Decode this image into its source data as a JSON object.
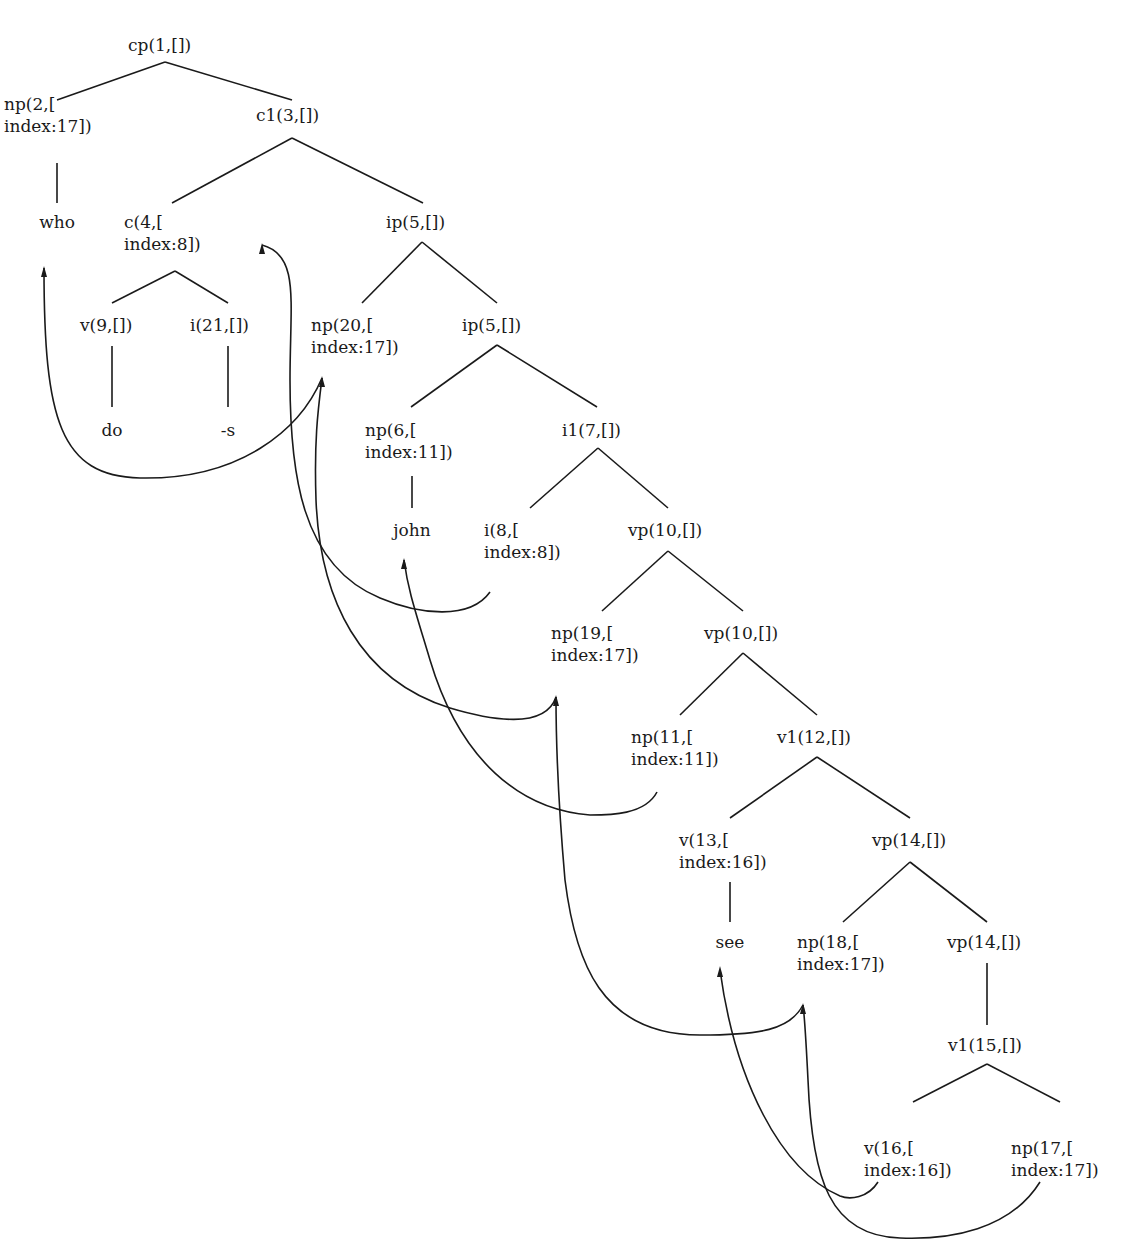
{
  "diagram": {
    "type": "syntax-tree",
    "line_color": "#1a1a1a",
    "nodes": [
      {
        "id": "cp1",
        "lines": [
          "cp(1,[])"
        ],
        "x": 128,
        "y": 34
      },
      {
        "id": "np2",
        "lines": [
          "np(2,[",
          "index:17])"
        ],
        "x": 4,
        "y": 93
      },
      {
        "id": "c1_3",
        "lines": [
          "c1(3,[])"
        ],
        "x": 256,
        "y": 104
      },
      {
        "id": "who",
        "lines": [
          "who"
        ],
        "x": 57,
        "y": 211,
        "leaf": true
      },
      {
        "id": "c4",
        "lines": [
          "c(4,[",
          "index:8])"
        ],
        "x": 124,
        "y": 211
      },
      {
        "id": "ip5a",
        "lines": [
          "ip(5,[])"
        ],
        "x": 386,
        "y": 211
      },
      {
        "id": "v9",
        "lines": [
          "v(9,[])"
        ],
        "x": 80,
        "y": 314
      },
      {
        "id": "i21",
        "lines": [
          "i(21,[])"
        ],
        "x": 190,
        "y": 314
      },
      {
        "id": "np20",
        "lines": [
          "np(20,[",
          "index:17])"
        ],
        "x": 311,
        "y": 314
      },
      {
        "id": "ip5b",
        "lines": [
          "ip(5,[])"
        ],
        "x": 462,
        "y": 314
      },
      {
        "id": "do",
        "lines": [
          "do"
        ],
        "x": 112,
        "y": 419,
        "leaf": true
      },
      {
        "id": "s",
        "lines": [
          "-s"
        ],
        "x": 228,
        "y": 419,
        "leaf": true
      },
      {
        "id": "np6",
        "lines": [
          "np(6,[",
          "index:11])"
        ],
        "x": 365,
        "y": 419
      },
      {
        "id": "i1_7",
        "lines": [
          "i1(7,[])"
        ],
        "x": 562,
        "y": 419
      },
      {
        "id": "john",
        "lines": [
          "john"
        ],
        "x": 412,
        "y": 519,
        "leaf": true
      },
      {
        "id": "i8",
        "lines": [
          "i(8,[",
          "index:8])"
        ],
        "x": 484,
        "y": 519
      },
      {
        "id": "vp10a",
        "lines": [
          "vp(10,[])"
        ],
        "x": 628,
        "y": 519
      },
      {
        "id": "np19",
        "lines": [
          "np(19,[",
          "index:17])"
        ],
        "x": 551,
        "y": 622
      },
      {
        "id": "vp10b",
        "lines": [
          "vp(10,[])"
        ],
        "x": 704,
        "y": 622
      },
      {
        "id": "np11",
        "lines": [
          "np(11,[",
          "index:11])"
        ],
        "x": 631,
        "y": 726
      },
      {
        "id": "v1_12",
        "lines": [
          "v1(12,[])"
        ],
        "x": 777,
        "y": 726
      },
      {
        "id": "v13",
        "lines": [
          "v(13,[",
          "index:16])"
        ],
        "x": 679,
        "y": 829
      },
      {
        "id": "vp14a",
        "lines": [
          "vp(14,[])"
        ],
        "x": 872,
        "y": 829
      },
      {
        "id": "see",
        "lines": [
          "see"
        ],
        "x": 730,
        "y": 931,
        "leaf": true
      },
      {
        "id": "np18",
        "lines": [
          "np(18,[",
          "index:17])"
        ],
        "x": 797,
        "y": 931
      },
      {
        "id": "vp14b",
        "lines": [
          "vp(14,[])"
        ],
        "x": 947,
        "y": 931
      },
      {
        "id": "v1_15",
        "lines": [
          "v1(15,[])"
        ],
        "x": 948,
        "y": 1034
      },
      {
        "id": "v16",
        "lines": [
          "v(16,[",
          "index:16])"
        ],
        "x": 864,
        "y": 1137
      },
      {
        "id": "np17",
        "lines": [
          "np(17,[",
          "index:17])"
        ],
        "x": 1011,
        "y": 1137
      }
    ],
    "edges": [
      [
        165,
        62,
        57,
        100
      ],
      [
        165,
        62,
        292,
        100
      ],
      [
        57,
        163,
        57,
        203
      ],
      [
        292,
        138,
        172,
        203
      ],
      [
        292,
        138,
        423,
        203
      ],
      [
        175,
        271,
        112,
        303
      ],
      [
        175,
        271,
        228,
        303
      ],
      [
        422,
        242,
        362,
        303
      ],
      [
        422,
        242,
        497,
        303
      ],
      [
        112,
        346,
        112,
        407
      ],
      [
        228,
        346,
        228,
        407
      ],
      [
        497,
        345,
        411,
        407
      ],
      [
        497,
        345,
        597,
        407
      ],
      [
        412,
        476,
        412,
        508
      ],
      [
        598,
        448,
        530,
        508
      ],
      [
        598,
        448,
        668,
        508
      ],
      [
        668,
        551,
        602,
        611
      ],
      [
        668,
        551,
        743,
        611
      ],
      [
        743,
        653,
        680,
        715
      ],
      [
        743,
        653,
        817,
        715
      ],
      [
        817,
        757,
        730,
        818
      ],
      [
        817,
        757,
        910,
        818
      ],
      [
        730,
        882,
        730,
        922
      ],
      [
        910,
        862,
        843,
        922
      ],
      [
        910,
        862,
        987,
        922
      ],
      [
        987,
        963,
        987,
        1025
      ],
      [
        987,
        1064,
        913,
        1102
      ],
      [
        987,
        1064,
        1060,
        1102
      ]
    ],
    "movement_arrows": [
      {
        "from": "np20",
        "to": "who",
        "d": "M 322 378 C 300 430 240 480 140 478 C 60 476 44 420 44 268",
        "head": [
          44,
          268
        ]
      },
      {
        "from": "i8",
        "to": "c4",
        "d": "M 490 592 C 470 620 420 615 380 598 C 300 565 290 470 290 380 C 290 300 300 255 262 245",
        "head": [
          262,
          245
        ]
      },
      {
        "from": "np19",
        "to": "np20",
        "d": "M 556 697 C 545 730 490 720 450 708 C 360 680 320 600 316 500 C 314 440 318 410 322 378",
        "head": [
          322,
          378
        ]
      },
      {
        "from": "np11",
        "to": "john",
        "d": "M 657 792 C 645 815 610 815 590 815 C 520 810 460 760 430 660 C 415 610 408 590 404 560",
        "head": [
          404,
          560
        ]
      },
      {
        "from": "np18",
        "to": "np19",
        "d": "M 803 1005 C 790 1030 760 1035 700 1035 C 600 1035 575 960 565 880 C 558 800 556 740 556 697",
        "head": [
          556,
          697
        ]
      },
      {
        "from": "v16",
        "to": "see",
        "d": "M 878 1182 C 868 1198 850 1200 840 1196 C 780 1170 735 1080 720 970",
        "head": [
          720,
          968
        ]
      },
      {
        "from": "np17",
        "to": "np18",
        "d": "M 1040 1182 C 1010 1230 950 1240 900 1238 C 830 1236 812 1180 808 1080 C 806 1040 805 1020 803 1005",
        "head": [
          803,
          1005
        ]
      }
    ]
  }
}
